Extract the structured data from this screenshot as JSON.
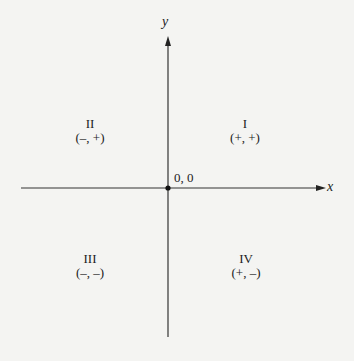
{
  "diagram": {
    "axes": {
      "x_label": "x",
      "y_label": "y"
    },
    "origin_label": "0, 0",
    "quadrants": [
      {
        "numeral": "I",
        "signs": "(+, +)"
      },
      {
        "numeral": "II",
        "signs": "(–, +)"
      },
      {
        "numeral": "III",
        "signs": "(–, –)"
      },
      {
        "numeral": "IV",
        "signs": "(+, –)"
      }
    ],
    "colors": {
      "background": "#f4f4f2",
      "ink": "#222222"
    }
  }
}
